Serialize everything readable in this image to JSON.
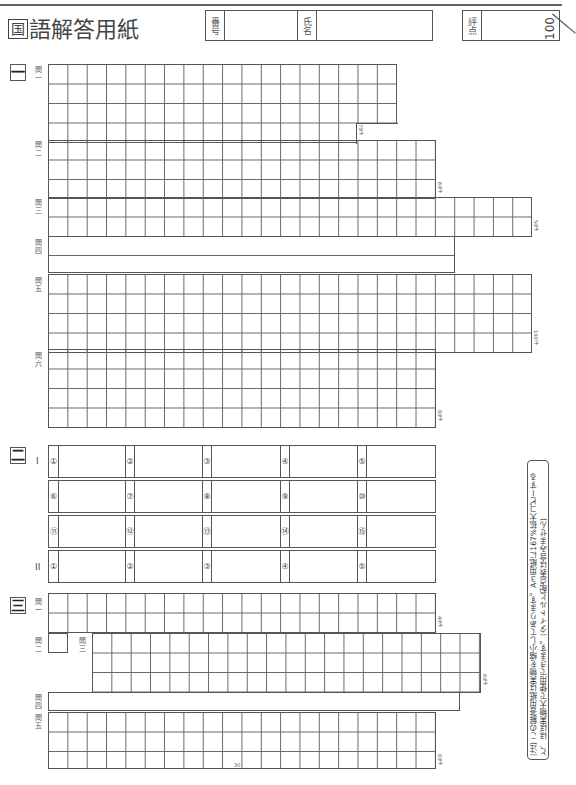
{
  "header": {
    "title_prefix": "国",
    "title_rest": "語解答用紙",
    "number_label": "番号",
    "name_label": "氏名",
    "score_label": "評点",
    "score_max": "100"
  },
  "section1": {
    "mark": "一",
    "q1": {
      "label": "問一",
      "count": "75字"
    },
    "q2": {
      "label": "問二",
      "count": "60字"
    },
    "q3": {
      "label": "問三",
      "count": "50字"
    },
    "q4": {
      "label": "問四"
    },
    "q5": {
      "label": "問五",
      "count": "100字"
    },
    "q6": {
      "label": "問六",
      "count": "80字"
    }
  },
  "section2": {
    "mark": "二",
    "part1": "I",
    "part2": "II",
    "rows": [
      [
        "①",
        "②",
        "③",
        "④",
        "⑤"
      ],
      [
        "⑥",
        "⑦",
        "⑧",
        "⑨",
        "⑩"
      ],
      [
        "⑪",
        "⑫",
        "⑬",
        "⑭",
        "⑮"
      ],
      [
        "①",
        "②",
        "③",
        "④",
        "⑤"
      ]
    ]
  },
  "section3": {
    "mark": "三",
    "q1": {
      "label": "問一",
      "count": "40字"
    },
    "q2": {
      "label": "問二"
    },
    "q3": {
      "label": "問三",
      "count": "60字"
    },
    "q4": {
      "label": "問四"
    },
    "q5": {
      "label": "問五",
      "count": "60字",
      "mid_marker": "30"
    }
  },
  "note": "(注) この解答用紙は実物を縮小してあります。A３用紙に167%拡大コピーすると、ほぼ実物大で使用できます。(タイトルと配点表は含みません)"
}
